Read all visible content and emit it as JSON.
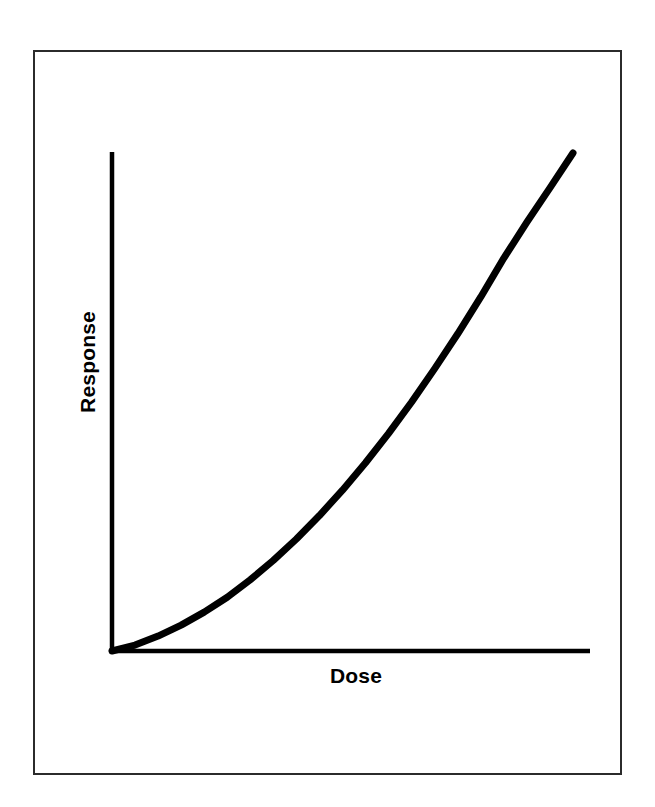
{
  "figure": {
    "background_color": "#ffffff",
    "frame_color": "#2b2b2b",
    "ink_color": "#000000"
  },
  "labels": {
    "y_axis_title": "Response",
    "x_axis_title": "Dose"
  },
  "chart_data": {
    "type": "line",
    "title": "",
    "subtitle": "",
    "xlabel": "Dose",
    "ylabel": "Response",
    "legend": [],
    "legend_position": "none",
    "grid": false,
    "axis_ticks": false,
    "tick_labels": {
      "x": [],
      "y": []
    },
    "xlim": [
      0,
      1
    ],
    "ylim": [
      0,
      1
    ],
    "annotations": [],
    "series": [
      {
        "name": "dose-response",
        "style": "solid",
        "color": "#000000",
        "line_width": 7,
        "description": "Monotonically increasing convex (supralinear) dose-response curve rising from the origin",
        "x": [
          0.0,
          0.05,
          0.1,
          0.15,
          0.2,
          0.25,
          0.3,
          0.35,
          0.4,
          0.45,
          0.5,
          0.55,
          0.6,
          0.65,
          0.7,
          0.75,
          0.8,
          0.85,
          0.9,
          0.95,
          1.0
        ],
        "y": [
          0.0,
          0.012,
          0.03,
          0.052,
          0.078,
          0.108,
          0.143,
          0.182,
          0.225,
          0.272,
          0.323,
          0.378,
          0.437,
          0.5,
          0.567,
          0.637,
          0.711,
          0.789,
          0.861,
          0.93,
          1.0
        ]
      }
    ]
  },
  "geometry": {
    "origin_x_px": 112,
    "origin_y_px": 651,
    "y_axis_top_px": 152,
    "x_axis_right_px": 590,
    "curve_end_x_px": 573,
    "curve_end_y_px": 153,
    "axis_line_width_px": 4
  }
}
